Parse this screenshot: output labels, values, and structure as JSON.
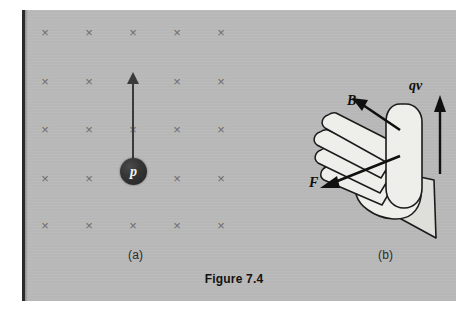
{
  "figure": {
    "caption": "Figure 7.4",
    "panels": [
      {
        "id": "a",
        "label": "(a)"
      },
      {
        "id": "b",
        "label": "(b)"
      }
    ]
  },
  "panel_a": {
    "particle_label": "p",
    "field_symbol": "×",
    "field_grid": {
      "columns": 5,
      "rows": 5,
      "x_positions": [
        45,
        89,
        133,
        177,
        221
      ],
      "y_positions": [
        33,
        82,
        130,
        179,
        226
      ],
      "hidden_cells": [
        [
          1,
          2
        ],
        [
          3,
          2
        ]
      ]
    },
    "velocity_arrow": {
      "direction": "up",
      "from": [
        133,
        170
      ],
      "to": [
        133,
        72
      ]
    }
  },
  "panel_b": {
    "vectors": [
      {
        "name": "B",
        "label": "B",
        "direction": "up-left"
      },
      {
        "name": "qv",
        "label": "qv",
        "direction": "up"
      },
      {
        "name": "F",
        "label": "F",
        "direction": "down-left"
      }
    ],
    "hand": "open-left-hand-fingers-up-left-thumb-up"
  },
  "colors": {
    "plate_background": "#b9b9b9",
    "field_mark": "#6d6d6d",
    "ink": "#101010",
    "particle_fill": "#2e2e2e",
    "particle_text": "#f2f2f2",
    "hand_fill": "#eeeeea",
    "hand_stroke": "#1b1b1b",
    "gutter": "#2b2b2b"
  }
}
